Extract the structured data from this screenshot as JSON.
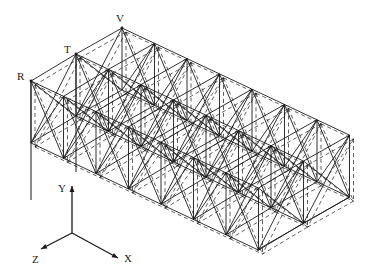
{
  "figure": {
    "type": "truss-structure-isometric",
    "stroke_color": "#1a1a1a",
    "node_labels": [
      {
        "text": "R",
        "x": 17,
        "y": 71
      },
      {
        "text": "T",
        "x": 64,
        "y": 44
      },
      {
        "text": "V",
        "x": 116,
        "y": 13
      }
    ],
    "axes": {
      "origin": [
        72,
        233
      ],
      "y_tip": [
        72,
        186
      ],
      "z_tip": [
        41,
        249
      ],
      "x_tip": [
        118,
        258
      ],
      "labels": [
        {
          "text": "Y",
          "x": 58,
          "y": 183
        },
        {
          "text": "Z",
          "x": 32,
          "y": 254
        },
        {
          "text": "X",
          "x": 124,
          "y": 253
        }
      ]
    },
    "geometry": {
      "V": [
        122,
        28
      ],
      "R": [
        31,
        81
      ],
      "T": [
        76,
        54
      ],
      "dx": [
        32.5,
        15.3
      ],
      "bays": 7,
      "height": 62,
      "deform_offset": [
        4,
        4
      ],
      "bottom_vertex": [
        257,
        250
      ],
      "post_bottoms": {
        "R": [
          31,
          200
        ],
        "T": [
          76,
          172
        ]
      }
    }
  }
}
